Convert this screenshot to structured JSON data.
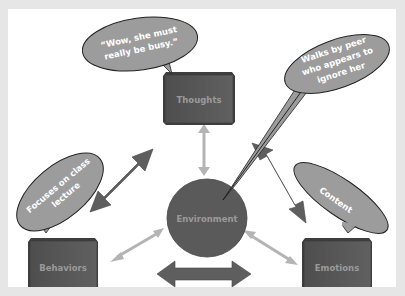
{
  "diagram": {
    "nodes": {
      "thoughts": {
        "label": "Thoughts"
      },
      "behaviors": {
        "label": "Behaviors"
      },
      "emotions": {
        "label": "Emotions"
      },
      "environment": {
        "label": "Environment"
      }
    },
    "bubbles": {
      "thought_quote": {
        "line1": "“Wow, she must",
        "line2": "really be busy.”"
      },
      "environment_event": {
        "line1": "Walks by peer",
        "line2": "who appears to",
        "line3": "ignore her"
      },
      "behavior": {
        "line1": "Focuses on class",
        "line2": "lecture"
      },
      "emotion": {
        "line1": "Content"
      }
    },
    "colors": {
      "background": "#e6e6e6",
      "slide": "#ffffff",
      "box_fill": "#5c5c5c",
      "box_top": "#484848",
      "circle_fill": "#5a5a5a",
      "bubble_fill": "#9c9c9c",
      "dark_arrow": "#5e5e5e",
      "light_arrow": "#b4b4b4",
      "label_text": "#9a9a9a"
    }
  }
}
